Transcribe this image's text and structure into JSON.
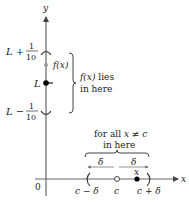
{
  "axes": {
    "y_label": "y",
    "x_label": "x",
    "origin_label": "0"
  },
  "y_axis_labels": {
    "upper": {
      "main": "L +",
      "num": "1",
      "den": "10"
    },
    "center": "L",
    "lower": {
      "main": "L −",
      "num": "1",
      "den": "10"
    },
    "fx_point": "f(x)"
  },
  "y_brace": {
    "line1": "f(x) lies",
    "line2": "in here"
  },
  "x_axis_labels": {
    "left": "c − δ",
    "center": "c",
    "right": "c + δ",
    "x_point": "x"
  },
  "x_brace": {
    "line1": "for all x ≠ c",
    "line2": "in here"
  },
  "delta_labels": {
    "left": "δ",
    "right": "δ"
  },
  "colors": {
    "axis": "#555555",
    "text": "#222222",
    "fx_dot": "#999999",
    "point": "#000000"
  }
}
